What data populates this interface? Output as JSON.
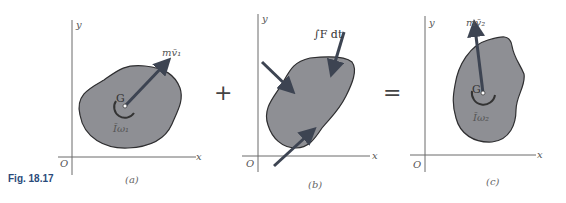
{
  "figure": {
    "label": "Fig. 18.17",
    "operators": {
      "plus": "+",
      "equals": "="
    },
    "colors": {
      "body_fill": "#8e8f94",
      "arrow": "#3d4452",
      "figure_label": "#2a4a7a"
    }
  },
  "panels": [
    {
      "caption": "(a)",
      "axes": {
        "x": "x",
        "y": "y",
        "origin": "O"
      },
      "center_label": "G",
      "momentum_label": "mv̄₁",
      "angular_label": "Īω₁"
    },
    {
      "caption": "(b)",
      "axes": {
        "x": "x",
        "y": "y",
        "origin": "O"
      },
      "impulse_label": "∫F dt"
    },
    {
      "caption": "(c)",
      "axes": {
        "x": "x",
        "y": "y",
        "origin": "O"
      },
      "center_label": "G",
      "momentum_label": "mv̄₂",
      "angular_label": "Īω₂"
    }
  ]
}
